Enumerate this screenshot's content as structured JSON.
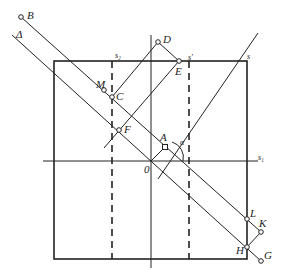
{
  "diagram": {
    "type": "geometry-construction",
    "colors": {
      "stroke": "#222222",
      "background": "#ffffff"
    },
    "points": {
      "B": "B",
      "D": "D",
      "E": "E",
      "M": "M",
      "C": "C",
      "F": "F",
      "A": "A",
      "O": "0",
      "L": "L",
      "K": "K",
      "H": "H",
      "G": "G"
    },
    "lines": {
      "delta": "Δ",
      "s": "s",
      "s_prime": "s'",
      "s1": "s₁",
      "s2": "s₂"
    },
    "angle": "α"
  }
}
